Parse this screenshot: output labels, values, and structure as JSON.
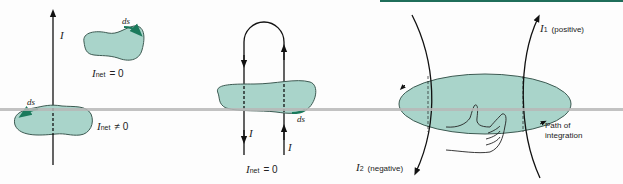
{
  "colors": {
    "top_bar": "#1f6e5a",
    "blob_fill": "#a9d4ca",
    "blob_stroke": "#3d5a52",
    "ds_accent": "#1b7a5c",
    "horizon_line": "#b7b7b7",
    "wire": "#111111"
  },
  "panel_a": {
    "current_label": "I",
    "upper_loop": {
      "ds": "ds",
      "i_net_symbol": "I",
      "i_net_sub": "net",
      "relation": "= 0"
    },
    "lower_loop": {
      "ds": "ds",
      "i_net_symbol": "I",
      "i_net_sub": "net",
      "relation": "≠ 0"
    }
  },
  "panel_b": {
    "current_left": "I",
    "current_right": "I",
    "ds": "ds",
    "i_net_symbol": "I",
    "i_net_sub": "net",
    "relation": "= 0"
  },
  "panel_c": {
    "i1_symbol": "I",
    "i1_sub": "1",
    "i1_note": "(positive)",
    "i2_symbol": "I",
    "i2_sub": "2",
    "i2_note": "(negative)",
    "path_label_line1": "Path of",
    "path_label_line2": "integration",
    "hand_icon": "right-hand-rule-icon"
  }
}
